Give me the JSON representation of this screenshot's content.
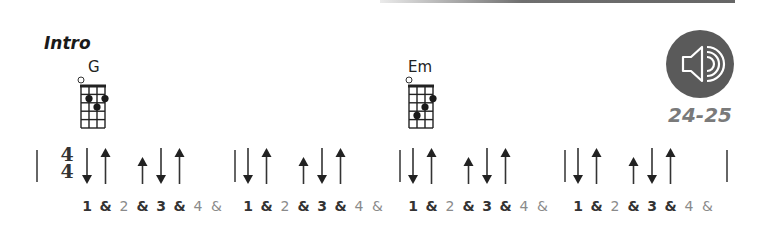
{
  "section": {
    "title": "Intro"
  },
  "chords": [
    {
      "name": "G",
      "x": 80,
      "open_strings": [
        1
      ],
      "dots": [
        {
          "string": 2,
          "fret": 2
        },
        {
          "string": 4,
          "fret": 2
        },
        {
          "string": 3,
          "fret": 3
        }
      ]
    },
    {
      "name": "Em",
      "x": 408,
      "open_strings": [
        1
      ],
      "dots": [
        {
          "string": 4,
          "fret": 2
        },
        {
          "string": 3,
          "fret": 3
        },
        {
          "string": 2,
          "fret": 4
        }
      ]
    }
  ],
  "audio": {
    "icon": "speaker-icon",
    "pages": "24-25",
    "circle_color": "#5a5a5a"
  },
  "time_signature": {
    "top": "4",
    "bottom": "4"
  },
  "strum_pattern": {
    "measures": 4,
    "strokes": [
      {
        "direction": "down",
        "beat": "1",
        "length": "long"
      },
      {
        "direction": "up",
        "beat": "&",
        "length": "long"
      },
      {
        "direction": "up",
        "beat": "&",
        "after": "2",
        "length": "short"
      },
      {
        "direction": "down",
        "beat": "3",
        "length": "long"
      },
      {
        "direction": "up",
        "beat": "&",
        "length": "long"
      }
    ]
  },
  "counts": [
    {
      "label": "1",
      "strong": true
    },
    {
      "label": "&",
      "strong": true
    },
    {
      "label": "2",
      "strong": false
    },
    {
      "label": "&",
      "strong": true
    },
    {
      "label": "3",
      "strong": true
    },
    {
      "label": "&",
      "strong": true
    },
    {
      "label": "4",
      "strong": false
    },
    {
      "label": "&",
      "strong": false
    }
  ]
}
